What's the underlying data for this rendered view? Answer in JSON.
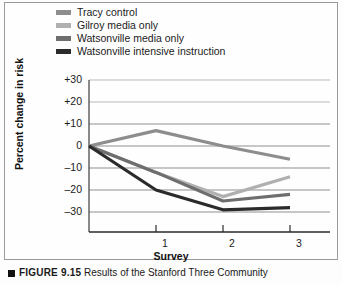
{
  "figure": {
    "caption_marker": "square-bullet",
    "caption_number": "FIGURE 9.15",
    "caption_text": "Results of the Stanford Three Community"
  },
  "legend": {
    "position": "top-left",
    "items": [
      {
        "label": "Tracy control",
        "color": "#8d8d8d"
      },
      {
        "label": "Gilroy media only",
        "color": "#b0b0b0"
      },
      {
        "label": "Watsonville media only",
        "color": "#6e6e6e"
      },
      {
        "label": "Watsonville intensive instruction",
        "color": "#2b2b2b"
      }
    ]
  },
  "axes": {
    "y_title": "Percent change in risk",
    "x_title": "Survey",
    "y_ticks": [
      "+30",
      "+20",
      "+10",
      "0",
      "–10",
      "–20",
      "–30"
    ],
    "x_ticks": [
      "1",
      "2",
      "3"
    ]
  },
  "chart_data": {
    "type": "line",
    "title": "",
    "subtitle": "",
    "xlabel": "Survey",
    "ylabel": "Percent change in risk",
    "x": [
      0,
      1,
      2,
      3
    ],
    "xtick_labels": [
      "",
      "1",
      "2",
      "3"
    ],
    "ytick_labels": [
      "+30",
      "+20",
      "+10",
      "0",
      "-10",
      "-20",
      "-30"
    ],
    "ytick_values": [
      30,
      20,
      10,
      0,
      -10,
      -20,
      -30
    ],
    "ylim": [
      -34,
      32
    ],
    "xlim": [
      0,
      3.45
    ],
    "grid": true,
    "grid_axis": "y",
    "legend_position": "above-plot-left",
    "series": [
      {
        "name": "Tracy control",
        "color": "#8d8d8d",
        "values": [
          0,
          7,
          0,
          -6
        ]
      },
      {
        "name": "Gilroy media only",
        "color": "#b0b0b0",
        "values": [
          0,
          -12,
          -23,
          -14
        ]
      },
      {
        "name": "Watsonville media only",
        "color": "#6e6e6e",
        "values": [
          0,
          -12,
          -25,
          -22
        ]
      },
      {
        "name": "Watsonville intensive instruction",
        "color": "#2b2b2b",
        "values": [
          0,
          -20,
          -29,
          -28
        ]
      }
    ]
  }
}
